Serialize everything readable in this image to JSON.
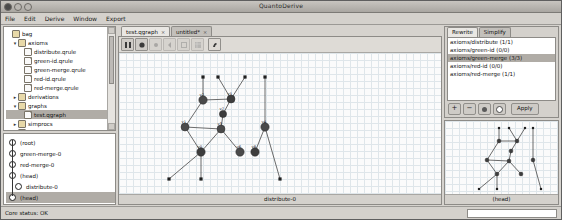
{
  "window": {
    "title": "QuantoDerive",
    "controls": [
      "close",
      "minimize",
      "zoom"
    ]
  },
  "menubar": {
    "items": [
      "File",
      "Edit",
      "Derive",
      "Window",
      "Export"
    ]
  },
  "project_tree": {
    "nodes": [
      {
        "label": "bag",
        "depth": 0,
        "type": "folder",
        "twist": "",
        "selected": false
      },
      {
        "label": "axioms",
        "depth": 1,
        "type": "folder",
        "twist": "▾",
        "selected": false
      },
      {
        "label": "distribute.qrule",
        "depth": 2,
        "type": "file",
        "twist": "",
        "selected": false
      },
      {
        "label": "green-id.qrule",
        "depth": 2,
        "type": "file",
        "twist": "",
        "selected": false
      },
      {
        "label": "green-merge.qrule",
        "depth": 2,
        "type": "file",
        "twist": "",
        "selected": false
      },
      {
        "label": "red-id.qrule",
        "depth": 2,
        "type": "file",
        "twist": "",
        "selected": false
      },
      {
        "label": "red-merge.qrule",
        "depth": 2,
        "type": "file",
        "twist": "",
        "selected": false
      },
      {
        "label": "derivations",
        "depth": 1,
        "type": "folder",
        "twist": "▸",
        "selected": false
      },
      {
        "label": "graphs",
        "depth": 1,
        "type": "folder",
        "twist": "▾",
        "selected": false
      },
      {
        "label": "test.qgraph",
        "depth": 2,
        "type": "file",
        "twist": "",
        "selected": true
      },
      {
        "label": "simprocs",
        "depth": 1,
        "type": "folder",
        "twist": "▸",
        "selected": false
      },
      {
        "label": "theorems",
        "depth": 1,
        "type": "folder",
        "twist": "▸",
        "selected": false
      }
    ]
  },
  "history": {
    "items": [
      {
        "label": "(root)",
        "selected": false
      },
      {
        "label": "green-merge-0",
        "selected": false
      },
      {
        "label": "red-merge-0",
        "selected": false
      },
      {
        "label": "(head)",
        "selected": false
      },
      {
        "label": "distribute-0",
        "selected": false
      },
      {
        "label": "(head)",
        "selected": true
      }
    ]
  },
  "editor": {
    "tabs": [
      {
        "label": "test.qgraph",
        "close": "×",
        "active": true
      },
      {
        "label": "untitled*",
        "close": "×",
        "active": false
      }
    ],
    "toolbar": [
      {
        "name": "select-tool",
        "enabled": true
      },
      {
        "name": "add-vertex-tool",
        "enabled": true
      },
      {
        "name": "add-edge-tool",
        "enabled": false
      },
      {
        "name": "add-bang-box-tool",
        "enabled": false
      },
      {
        "name": "cut-tool",
        "enabled": false
      },
      {
        "name": "copy-tool",
        "enabled": false
      },
      {
        "name": "paste-tool",
        "enabled": true
      }
    ],
    "caption": "distribute-0"
  },
  "rewrite_panel": {
    "tabs": [
      {
        "label": "Rewrite",
        "active": true
      },
      {
        "label": "Simplify",
        "active": false
      }
    ],
    "rules": [
      {
        "label": "axioms/distribute (1/1)",
        "selected": false
      },
      {
        "label": "axioms/green-id (0/0)",
        "selected": false
      },
      {
        "label": "axioms/green-merge (3/3)",
        "selected": true
      },
      {
        "label": "axioms/red-id (0/0)",
        "selected": false
      },
      {
        "label": "axioms/red-merge (1/1)",
        "selected": false
      }
    ],
    "buttons": [
      {
        "name": "add-rule-button",
        "label": "+"
      },
      {
        "name": "remove-rule-button",
        "label": "−"
      },
      {
        "name": "first-match-button",
        "label": ""
      },
      {
        "name": "next-match-button",
        "label": ""
      }
    ],
    "apply_label": "Apply"
  },
  "preview": {
    "caption": "(head)"
  },
  "statusbar": {
    "text": "Core status: OK"
  },
  "graph_main": {
    "nodes": [
      {
        "id": "n0",
        "x": 78,
        "y": 43,
        "r": 4.2,
        "fill": "#4a4a4a",
        "label": "v2"
      },
      {
        "id": "n1",
        "x": 106,
        "y": 42,
        "r": 4.0,
        "fill": "#3d3d3d",
        "label": "v5"
      },
      {
        "id": "n2",
        "x": 98,
        "y": 57,
        "r": 3.6,
        "fill": "#3d3d3d",
        "label": "v7"
      },
      {
        "id": "n3",
        "x": 96,
        "y": 72,
        "r": 4.0,
        "fill": "#4a4a4a",
        "label": "v3"
      },
      {
        "id": "n4",
        "x": 60,
        "y": 70,
        "r": 4.0,
        "fill": "#4a4a4a",
        "label": "v1"
      },
      {
        "id": "n5",
        "x": 76,
        "y": 95,
        "r": 4.2,
        "fill": "#3d3d3d",
        "label": "v0"
      },
      {
        "id": "n6",
        "x": 115,
        "y": 95,
        "r": 4.2,
        "fill": "#4a4a4a",
        "label": "v6"
      },
      {
        "id": "n7",
        "x": 140,
        "y": 70,
        "r": 4.2,
        "fill": "#4a4a4a",
        "label": "v4"
      },
      {
        "id": "n8",
        "x": 130,
        "y": 95,
        "r": 4.2,
        "fill": "#3d3d3d",
        "label": "v8"
      }
    ],
    "boundaries": [
      {
        "id": "b0",
        "x": 78,
        "y": 20
      },
      {
        "id": "b1",
        "x": 93,
        "y": 20
      },
      {
        "id": "b2",
        "x": 120,
        "y": 20
      },
      {
        "id": "b3",
        "x": 140,
        "y": 20
      },
      {
        "id": "b4",
        "x": 44,
        "y": 122
      },
      {
        "id": "b5",
        "x": 76,
        "y": 122
      },
      {
        "id": "b6",
        "x": 155,
        "y": 122
      }
    ],
    "edges": [
      [
        "b0",
        "n0"
      ],
      [
        "b1",
        "n1"
      ],
      [
        "b2",
        "n1"
      ],
      [
        "b3",
        "n7"
      ],
      [
        "n0",
        "n1"
      ],
      [
        "n1",
        "n2"
      ],
      [
        "n2",
        "n3"
      ],
      [
        "n0",
        "n4"
      ],
      [
        "n3",
        "n4"
      ],
      [
        "n3",
        "n5"
      ],
      [
        "n4",
        "n5"
      ],
      [
        "n3",
        "n6"
      ],
      [
        "n5",
        "b4"
      ],
      [
        "n5",
        "b5"
      ],
      [
        "n7",
        "n8"
      ],
      [
        "n7",
        "b6"
      ]
    ]
  },
  "graph_preview": {
    "nodes": [
      {
        "id": "p0",
        "x": 44,
        "y": 18
      },
      {
        "id": "p1",
        "x": 62,
        "y": 18
      },
      {
        "id": "p2",
        "x": 56,
        "y": 28
      },
      {
        "id": "p3",
        "x": 54,
        "y": 38
      },
      {
        "id": "p4",
        "x": 32,
        "y": 37
      },
      {
        "id": "p5",
        "x": 42,
        "y": 51
      },
      {
        "id": "p6",
        "x": 66,
        "y": 51
      },
      {
        "id": "p7",
        "x": 78,
        "y": 37
      }
    ],
    "boundaries": [
      {
        "id": "q0",
        "x": 44,
        "y": 5
      },
      {
        "id": "q1",
        "x": 54,
        "y": 5
      },
      {
        "id": "q2",
        "x": 70,
        "y": 5
      },
      {
        "id": "q3",
        "x": 78,
        "y": 5
      },
      {
        "id": "q4",
        "x": 24,
        "y": 66
      },
      {
        "id": "q5",
        "x": 42,
        "y": 66
      },
      {
        "id": "q6",
        "x": 86,
        "y": 66
      }
    ],
    "edges": [
      [
        "q0",
        "p0"
      ],
      [
        "q1",
        "p1"
      ],
      [
        "q2",
        "p1"
      ],
      [
        "q3",
        "p7"
      ],
      [
        "p0",
        "p1"
      ],
      [
        "p1",
        "p2"
      ],
      [
        "p2",
        "p3"
      ],
      [
        "p0",
        "p4"
      ],
      [
        "p3",
        "p4"
      ],
      [
        "p3",
        "p5"
      ],
      [
        "p4",
        "p5"
      ],
      [
        "p3",
        "p6"
      ],
      [
        "p5",
        "q4"
      ],
      [
        "p5",
        "q5"
      ],
      [
        "p7",
        "q6"
      ]
    ]
  }
}
